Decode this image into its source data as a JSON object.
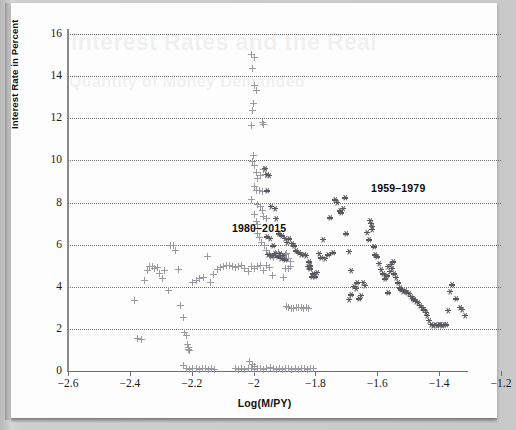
{
  "figure": {
    "ghost_text_top": "Interest Rates and the Real",
    "ghost_text_bottom": "Quantity of Money Demanded"
  },
  "chart_data": {
    "type": "scatter",
    "title": "",
    "xlabel": "Log(M/PY)",
    "ylabel": "Interest Rate in Percent",
    "xlim": [
      -2.6,
      -1.2
    ],
    "ylim": [
      0,
      16
    ],
    "xticks": [
      -2.6,
      -2.4,
      -2.2,
      -2,
      -1.8,
      -1.6,
      -1.4,
      -1.2
    ],
    "xtick_labels": [
      "-2.6",
      "-2.4",
      "-2.2",
      "-2",
      "-1.8",
      "-1.6",
      "-1.4",
      "-1.2"
    ],
    "yticks": [
      0,
      2,
      4,
      6,
      8,
      10,
      12,
      14,
      16
    ],
    "ytick_labels": [
      "0",
      "2",
      "4",
      "6",
      "8",
      "10",
      "12",
      "14",
      "16"
    ],
    "grid": "horizontal-dotted",
    "legend_position": "inline-annotations",
    "annotations": [
      {
        "text": "1980-2015",
        "x": -2.07,
        "y": 6.75,
        "series": "1980-2015"
      },
      {
        "text": "1959-1979",
        "x": -1.62,
        "y": 8.65,
        "series": "1959-1979"
      }
    ],
    "series": [
      {
        "name": "1980-2015",
        "marker": "plus",
        "color": "#9a9aa2",
        "points": [
          [
            -2.385,
            3.35
          ],
          [
            -2.375,
            1.55
          ],
          [
            -2.362,
            1.48
          ],
          [
            -2.352,
            4.32
          ],
          [
            -2.344,
            4.78
          ],
          [
            -2.336,
            4.95
          ],
          [
            -2.328,
            4.98
          ],
          [
            -2.32,
            4.88
          ],
          [
            -2.312,
            4.92
          ],
          [
            -2.304,
            4.62
          ],
          [
            -2.296,
            4.4
          ],
          [
            -2.288,
            4.78
          ],
          [
            -2.276,
            3.8
          ],
          [
            -2.268,
            5.95
          ],
          [
            -2.26,
            5.98
          ],
          [
            -2.252,
            5.72
          ],
          [
            -2.244,
            4.82
          ],
          [
            -2.236,
            3.12
          ],
          [
            -2.228,
            2.55
          ],
          [
            -2.222,
            1.82
          ],
          [
            -2.218,
            1.7
          ],
          [
            -2.214,
            1.28
          ],
          [
            -2.212,
            1.12
          ],
          [
            -2.21,
            1.02
          ],
          [
            -2.208,
            0.95
          ],
          [
            -2.228,
            0.28
          ],
          [
            -2.216,
            0.1
          ],
          [
            -2.206,
            0.08
          ],
          [
            -2.196,
            0.12
          ],
          [
            -2.186,
            0.1
          ],
          [
            -2.176,
            0.08
          ],
          [
            -2.166,
            0.1
          ],
          [
            -2.156,
            0.12
          ],
          [
            -2.146,
            0.08
          ],
          [
            -2.136,
            0.1
          ],
          [
            -2.126,
            0.08
          ],
          [
            -2.198,
            4.22
          ],
          [
            -2.186,
            4.32
          ],
          [
            -2.174,
            4.4
          ],
          [
            -2.162,
            4.45
          ],
          [
            -2.15,
            5.42
          ],
          [
            -2.14,
            4.18
          ],
          [
            -2.128,
            4.58
          ],
          [
            -2.118,
            4.82
          ],
          [
            -2.108,
            4.9
          ],
          [
            -2.098,
            4.95
          ],
          [
            -2.088,
            5.02
          ],
          [
            -2.078,
            5.0
          ],
          [
            -2.068,
            4.96
          ],
          [
            -2.058,
            4.92
          ],
          [
            -2.048,
            4.98
          ],
          [
            -2.038,
            5.0
          ],
          [
            -2.028,
            4.88
          ],
          [
            -2.018,
            4.72
          ],
          [
            -2.008,
            4.95
          ],
          [
            -1.998,
            4.88
          ],
          [
            -1.988,
            4.98
          ],
          [
            -1.978,
            5.0
          ],
          [
            -1.968,
            4.78
          ],
          [
            -1.958,
            5.0
          ],
          [
            -1.948,
            4.9
          ],
          [
            -1.938,
            4.52
          ],
          [
            -2.006,
            15.05
          ],
          [
            -1.998,
            14.9
          ],
          [
            -2.002,
            14.35
          ],
          [
            -1.998,
            13.55
          ],
          [
            -1.992,
            13.3
          ],
          [
            -2.0,
            12.7
          ],
          [
            -2.002,
            12.35
          ],
          [
            -2.006,
            11.65
          ],
          [
            -1.972,
            11.8
          ],
          [
            -1.968,
            11.72
          ],
          [
            -2.0,
            10.25
          ],
          [
            -2.002,
            9.95
          ],
          [
            -1.996,
            9.75
          ],
          [
            -1.992,
            9.42
          ],
          [
            -1.986,
            9.15
          ],
          [
            -1.978,
            9.28
          ],
          [
            -1.968,
            9.58
          ],
          [
            -1.962,
            9.32
          ],
          [
            -1.998,
            8.75
          ],
          [
            -1.992,
            8.58
          ],
          [
            -1.982,
            8.55
          ],
          [
            -1.97,
            8.5
          ],
          [
            -2.006,
            8.15
          ],
          [
            -1.986,
            7.9
          ],
          [
            -1.978,
            7.8
          ],
          [
            -1.972,
            7.6
          ],
          [
            -1.968,
            7.35
          ],
          [
            -1.958,
            7.25
          ],
          [
            -1.998,
            7.42
          ],
          [
            -1.992,
            7.1
          ],
          [
            -1.986,
            6.95
          ],
          [
            -1.996,
            6.75
          ],
          [
            -1.988,
            6.52
          ],
          [
            -1.98,
            6.35
          ],
          [
            -1.974,
            6.12
          ],
          [
            -1.966,
            5.98
          ],
          [
            -1.958,
            5.72
          ],
          [
            -1.95,
            5.55
          ],
          [
            -1.944,
            5.45
          ],
          [
            -1.934,
            5.38
          ],
          [
            -1.928,
            5.6
          ],
          [
            -1.918,
            5.62
          ],
          [
            -1.912,
            5.5
          ],
          [
            -1.906,
            5.45
          ],
          [
            -1.898,
            5.55
          ],
          [
            -1.892,
            5.58
          ],
          [
            -1.886,
            5.35
          ],
          [
            -1.88,
            5.2
          ],
          [
            -1.896,
            4.88
          ],
          [
            -1.888,
            4.85
          ],
          [
            -1.88,
            4.95
          ],
          [
            -1.902,
            4.42
          ],
          [
            -1.894,
            3.05
          ],
          [
            -1.886,
            3.02
          ],
          [
            -1.878,
            2.98
          ],
          [
            -1.87,
            2.98
          ],
          [
            -1.862,
            3.0
          ],
          [
            -1.854,
            3.0
          ],
          [
            -1.846,
            3.02
          ],
          [
            -1.838,
            2.98
          ],
          [
            -1.83,
            3.0
          ],
          [
            -1.822,
            2.98
          ],
          [
            -1.946,
            0.18
          ],
          [
            -1.936,
            0.1
          ],
          [
            -1.926,
            0.08
          ],
          [
            -1.916,
            0.12
          ],
          [
            -1.906,
            0.08
          ],
          [
            -1.896,
            0.1
          ],
          [
            -1.886,
            0.12
          ],
          [
            -1.876,
            0.08
          ],
          [
            -1.866,
            0.1
          ],
          [
            -1.856,
            0.08
          ],
          [
            -1.846,
            0.12
          ],
          [
            -1.836,
            0.1
          ],
          [
            -1.826,
            0.08
          ],
          [
            -1.816,
            0.12
          ],
          [
            -1.806,
            0.1
          ],
          [
            -2.058,
            0.1
          ],
          [
            -2.048,
            0.08
          ],
          [
            -2.038,
            0.12
          ],
          [
            -2.028,
            0.08
          ],
          [
            -2.018,
            0.1
          ],
          [
            -2.008,
            0.12
          ],
          [
            -1.998,
            0.08
          ],
          [
            -1.988,
            0.1
          ],
          [
            -1.978,
            0.12
          ],
          [
            -1.968,
            0.08
          ],
          [
            -1.958,
            0.1
          ],
          [
            -2.012,
            0.45
          ],
          [
            -2.004,
            0.32
          ],
          [
            -1.996,
            0.22
          ]
        ]
      },
      {
        "name": "1959-1979",
        "marker": "star",
        "color": "#58585f",
        "points": [
          [
            -1.962,
            9.62
          ],
          [
            -1.956,
            9.35
          ],
          [
            -1.95,
            9.28
          ],
          [
            -1.958,
            8.55
          ],
          [
            -1.944,
            7.82
          ],
          [
            -1.932,
            7.72
          ],
          [
            -1.928,
            7.25
          ],
          [
            -1.918,
            6.52
          ],
          [
            -1.908,
            6.42
          ],
          [
            -1.9,
            6.3
          ],
          [
            -1.892,
            6.1
          ],
          [
            -1.884,
            6.28
          ],
          [
            -1.876,
            6.05
          ],
          [
            -1.87,
            5.95
          ],
          [
            -1.862,
            5.7
          ],
          [
            -1.854,
            5.62
          ],
          [
            -1.846,
            5.55
          ],
          [
            -1.838,
            5.52
          ],
          [
            -1.83,
            5.48
          ],
          [
            -1.822,
            5.18
          ],
          [
            -1.816,
            5.0
          ],
          [
            -1.808,
            4.62
          ],
          [
            -1.8,
            4.48
          ],
          [
            -1.796,
            4.7
          ],
          [
            -1.79,
            5.6
          ],
          [
            -1.782,
            5.38
          ],
          [
            -1.776,
            6.25
          ],
          [
            -1.768,
            5.35
          ],
          [
            -1.76,
            5.52
          ],
          [
            -1.752,
            7.28
          ],
          [
            -1.744,
            5.62
          ],
          [
            -1.736,
            8.12
          ],
          [
            -1.73,
            8.02
          ],
          [
            -1.722,
            7.6
          ],
          [
            -1.716,
            7.52
          ],
          [
            -1.71,
            7.72
          ],
          [
            -1.704,
            8.22
          ],
          [
            -1.7,
            6.52
          ],
          [
            -1.692,
            5.68
          ],
          [
            -1.684,
            4.78
          ],
          [
            -1.676,
            4.02
          ],
          [
            -1.67,
            3.92
          ],
          [
            -1.664,
            4.18
          ],
          [
            -1.658,
            3.42
          ],
          [
            -1.652,
            3.58
          ],
          [
            -1.646,
            4.22
          ],
          [
            -1.64,
            4.08
          ],
          [
            -1.634,
            6.58
          ],
          [
            -1.628,
            6.22
          ],
          [
            -1.622,
            7.15
          ],
          [
            -1.62,
            7.02
          ],
          [
            -1.618,
            6.88
          ],
          [
            -1.616,
            6.72
          ],
          [
            -1.612,
            5.9
          ],
          [
            -1.606,
            5.52
          ],
          [
            -1.6,
            5.42
          ],
          [
            -1.594,
            5.1
          ],
          [
            -1.588,
            4.82
          ],
          [
            -1.582,
            4.62
          ],
          [
            -1.576,
            4.38
          ],
          [
            -1.57,
            4.52
          ],
          [
            -1.564,
            3.72
          ],
          [
            -1.558,
            4.72
          ],
          [
            -1.552,
            4.88
          ],
          [
            -1.546,
            4.62
          ],
          [
            -1.54,
            4.45
          ],
          [
            -1.534,
            4.18
          ],
          [
            -1.528,
            3.95
          ],
          [
            -1.522,
            3.85
          ],
          [
            -1.516,
            3.78
          ],
          [
            -1.51,
            3.8
          ],
          [
            -1.504,
            3.72
          ],
          [
            -1.498,
            3.68
          ],
          [
            -1.492,
            3.55
          ],
          [
            -1.486,
            3.45
          ],
          [
            -1.48,
            3.38
          ],
          [
            -1.474,
            3.32
          ],
          [
            -1.468,
            3.25
          ],
          [
            -1.462,
            3.12
          ],
          [
            -1.456,
            3.02
          ],
          [
            -1.45,
            2.9
          ],
          [
            -1.444,
            2.78
          ],
          [
            -1.438,
            2.65
          ],
          [
            -1.432,
            2.42
          ],
          [
            -1.426,
            2.22
          ],
          [
            -1.42,
            2.18
          ],
          [
            -1.414,
            2.2
          ],
          [
            -1.408,
            2.18
          ],
          [
            -1.402,
            2.22
          ],
          [
            -1.396,
            2.2
          ],
          [
            -1.39,
            2.18
          ],
          [
            -1.384,
            2.22
          ],
          [
            -1.378,
            2.2
          ],
          [
            -1.372,
            2.88
          ],
          [
            -1.366,
            3.78
          ],
          [
            -1.358,
            4.1
          ],
          [
            -1.344,
            3.42
          ],
          [
            -1.334,
            3.02
          ],
          [
            -1.326,
            2.92
          ],
          [
            -1.318,
            2.65
          ],
          [
            -1.692,
            3.4
          ],
          [
            -1.684,
            3.62
          ],
          [
            -1.952,
            5.55
          ],
          [
            -1.944,
            5.5
          ],
          [
            -1.936,
            5.48
          ],
          [
            -1.93,
            5.6
          ],
          [
            -1.922,
            5.42
          ],
          [
            -1.916,
            5.58
          ],
          [
            -1.91,
            5.35
          ],
          [
            -1.904,
            5.5
          ],
          [
            -1.898,
            5.28
          ],
          [
            -1.956,
            6.38
          ],
          [
            -1.948,
            6.3
          ],
          [
            -1.938,
            5.95
          ],
          [
            -1.824,
            4.98
          ],
          [
            -1.818,
            4.85
          ],
          [
            -1.812,
            4.48
          ],
          [
            -1.564,
            4.98
          ],
          [
            -1.556,
            5.08
          ],
          [
            -1.548,
            5.18
          ]
        ]
      }
    ]
  }
}
